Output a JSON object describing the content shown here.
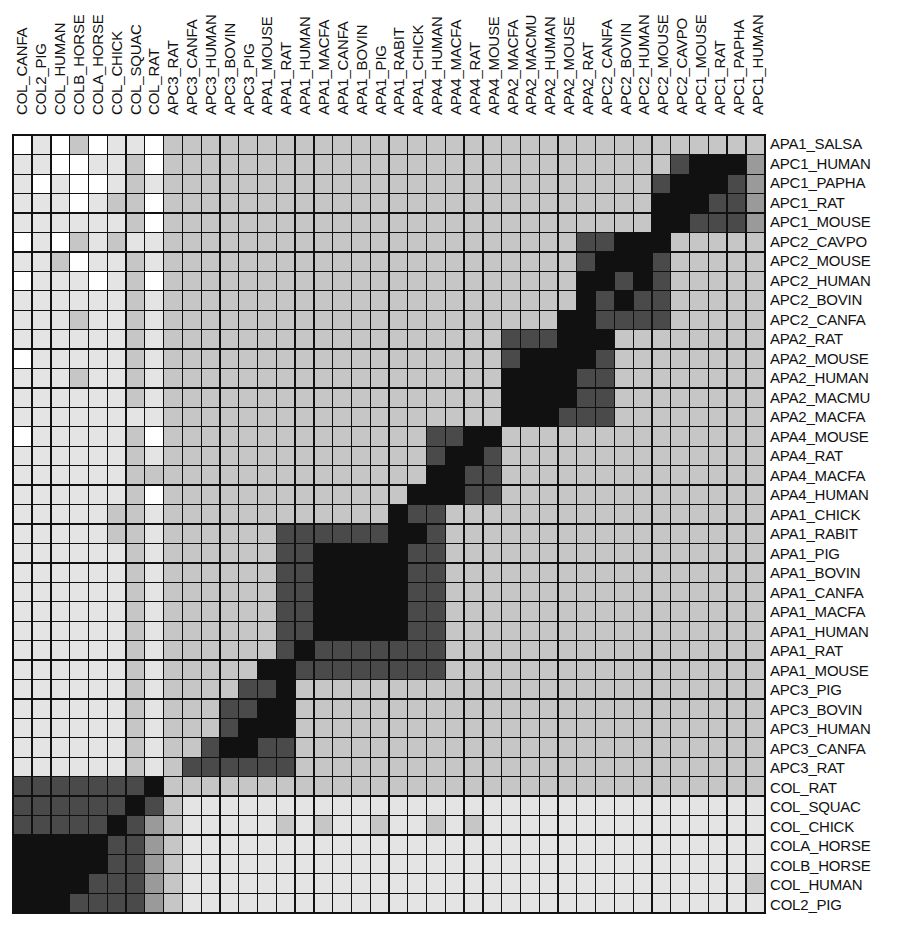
{
  "chart_data": {
    "type": "heatmap",
    "title": "",
    "xlabel": "",
    "ylabel": "",
    "levels_legend": [
      "0 white (least similar)",
      "1 very light stipple",
      "2 light stipple",
      "3 medium stipple",
      "4 dark",
      "5 black (most similar)"
    ],
    "shade_colors": [
      "#ffffff",
      "#e4e4e4",
      "#c6c6c6",
      "#9a9a9a",
      "#4a4a4a",
      "#111111"
    ],
    "column_labels": [
      "COL_CANFA",
      "COL2_PIG",
      "COL_HUMAN",
      "COLB_HORSE",
      "COLA_HORSE",
      "COL_CHICK",
      "COL_SQUAC",
      "COL_RAT",
      "APC3_RAT",
      "APC3_CANFA",
      "APC3_HUMAN",
      "APC3_BOVIN",
      "APC3_PIG",
      "APA1_MOUSE",
      "APA1_RAT",
      "APA1_HUMAN",
      "APA1_MACFA",
      "APA1_CANFA",
      "APA1_BOVIN",
      "APA1_PIG",
      "APA1_RABIT",
      "APA1_CHICK",
      "APA4_HUMAN",
      "APA4_MACFA",
      "APA4_RAT",
      "APA4_MOUSE",
      "APA2_MACFA",
      "APA2_MACMU",
      "APA2_HUMAN",
      "APA2_MOUSE",
      "APA2_RAT",
      "APC2_CANFA",
      "APC2_BOVIN",
      "APC2_HUMAN",
      "APC2_MOUSE",
      "APC2_CAVPO",
      "APC1_MOUSE",
      "APC1_RAT",
      "APC1_PAPHA",
      "APC1_HUMAN",
      "APA1_SALSA"
    ],
    "row_labels": [
      "APA1_SALSA",
      "APC1_HUMAN",
      "APC1_PAPHA",
      "APC1_RAT",
      "APC1_MOUSE",
      "APC2_CAVPO",
      "APC2_MOUSE",
      "APC2_HUMAN",
      "APC2_BOVIN",
      "APC2_CANFA",
      "APA2_RAT",
      "APA2_MOUSE",
      "APA2_HUMAN",
      "APA2_MACMU",
      "APA2_MACFA",
      "APA4_MOUSE",
      "APA4_RAT",
      "APA4_MACFA",
      "APA4_HUMAN",
      "APA1_CHICK",
      "APA1_RABIT",
      "APA1_PIG",
      "APA1_BOVIN",
      "APA1_CANFA",
      "APA1_MACFA",
      "APA1_HUMAN",
      "APA1_RAT",
      "APA1_MOUSE",
      "APC3_PIG",
      "APC3_BOVIN",
      "APC3_HUMAN",
      "APC3_CANFA",
      "APC3_RAT",
      "COL_RAT",
      "COL_SQUAC",
      "COL_CHICK",
      "COLA_HORSE",
      "COLB_HORSE",
      "COL_HUMAN",
      "COL2_PIG",
      "COL_CANFA"
    ],
    "families": [
      {
        "name": "APA1 (SALSA)",
        "rows": [
          0,
          0
        ]
      },
      {
        "name": "APC1",
        "rows": [
          1,
          4
        ]
      },
      {
        "name": "APC2",
        "rows": [
          5,
          9
        ]
      },
      {
        "name": "APA2",
        "rows": [
          10,
          14
        ]
      },
      {
        "name": "APA4",
        "rows": [
          15,
          18
        ]
      },
      {
        "name": "APA1",
        "rows": [
          19,
          27
        ]
      },
      {
        "name": "APC3",
        "rows": [
          28,
          32
        ]
      },
      {
        "name": "COL",
        "rows": [
          33,
          40
        ]
      }
    ],
    "matrix_rows": [
      "0102011022222222222222222222222222222222",
      "1100112022222222222222222222222222245553",
      "1010012122222222222222222222222222455543",
      "1110122022222222222222222222222222555443",
      "1111112022222222222222222222222222554443",
      "0102121122222222222222222222224455522222",
      "1120112122222222222222222222224555422222",
      "0111012022222222222222222222225545422222",
      "1111112122222222222222222222225454422222",
      "1112112122222222222222222222255444422222",
      "1111112122222222222222222244455522222222",
      "0111112122222222222222222245555422222222",
      "1112112122222222222222222255554422222222",
      "1111112122222222222222222255554422222222",
      "1111111122222222222222222255544422222222",
      "0111112022222222222222445522222222222222",
      "1111112122222222222222455422222222222222",
      "1111112222222222222222554422222222222222",
      "1111112022222222222225554422222222222222",
      "1111122122222222222254422222222222222222",
      "1111122122222244444455422222222222222222",
      "1111112122222244555554422222222222222222",
      "1111112122222244555554422222222222222222",
      "1111112122222244555554422222222222222222",
      "1111112122222244555554422222222222222222",
      "1111112122222244555554422222222222222222",
      "1111112122222245444444422222222222222222",
      "1111112122222554444444422222222222222222",
      "1111112122224452222222222222222222222222",
      "1111112122244552222222222222222222222222",
      "1111112122245552222222222222222222222222",
      "1111112122455442222222222222222222222222",
      "1111112124444442222222222222222222222222",
      "4444444522222222222222222222222222222222",
      "4444445421111111111111111111111111111111",
      "4444454321111121211211212111111111111111",
      "5555544321111111111111111111111111111111",
      "5555544321111111111111111111111111111111",
      "5555444321111111111111111111111111111112",
      "5554444321111111111111111111111111111111",
      "5544444321111111111111111111111111111111"
    ]
  }
}
